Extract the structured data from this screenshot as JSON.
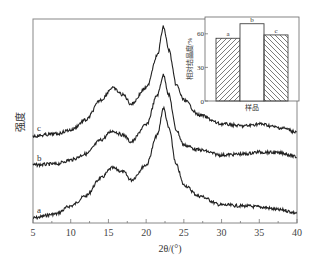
{
  "chart_data": [
    {
      "type": "line",
      "title": "",
      "xlabel": "2θ/(°)",
      "ylabel": "强度",
      "xlim": [
        5,
        40
      ],
      "xticks": [
        5,
        10,
        15,
        20,
        25,
        30,
        35,
        40
      ],
      "yticks": [],
      "grid": false,
      "legend": "inline labels at left of each curve",
      "series": [
        {
          "name": "a",
          "x": [
            5,
            8,
            10,
            12,
            14,
            15.5,
            17,
            18,
            20,
            21.5,
            22.3,
            23,
            24,
            25,
            27,
            30,
            33,
            35,
            38,
            40
          ],
          "y_px": [
            218,
            214,
            206,
            196,
            178,
            168,
            172,
            180,
            165,
            135,
            108,
            128,
            165,
            185,
            196,
            205,
            206,
            207,
            210,
            213
          ]
        },
        {
          "name": "b",
          "x": [
            5,
            8,
            10,
            12,
            14,
            15.5,
            17,
            18,
            20,
            21.5,
            22.3,
            23,
            24,
            25,
            27,
            30,
            33,
            35,
            38,
            40
          ],
          "y_px": [
            165,
            164,
            160,
            154,
            140,
            131,
            135,
            142,
            125,
            95,
            75,
            95,
            130,
            145,
            150,
            155,
            154,
            152,
            153,
            157
          ]
        },
        {
          "name": "c",
          "x": [
            5,
            8,
            10,
            12,
            14,
            15.5,
            17,
            18,
            20,
            21.5,
            22.3,
            23,
            24,
            25,
            27,
            30,
            33,
            35,
            38,
            40
          ],
          "y_px": [
            136,
            134,
            130,
            120,
            100,
            88,
            95,
            104,
            88,
            55,
            27,
            50,
            85,
            100,
            115,
            124,
            126,
            124,
            128,
            132
          ]
        }
      ]
    },
    {
      "type": "bar",
      "title": "",
      "xlabel": "样品",
      "ylabel": "相对结晶度/%",
      "categories": [
        "a",
        "b",
        "c"
      ],
      "values": [
        56,
        69,
        59
      ],
      "yticks": [
        0,
        30,
        60
      ],
      "ylim": [
        0,
        75
      ],
      "patterns": [
        "hatch-forward",
        "none",
        "hatch-back"
      ]
    }
  ],
  "main": {
    "xlabel": "2θ/(°)",
    "ylabel": "强度",
    "xticks": [
      "5",
      "10",
      "15",
      "20",
      "25",
      "30",
      "35",
      "40"
    ],
    "curve_labels": [
      "a",
      "b",
      "c"
    ]
  },
  "inset": {
    "xlabel": "样品",
    "ylabel": "相对结晶度/%",
    "yticks": [
      "0",
      "30",
      "60"
    ],
    "bar_labels": [
      "a",
      "b",
      "c"
    ]
  }
}
